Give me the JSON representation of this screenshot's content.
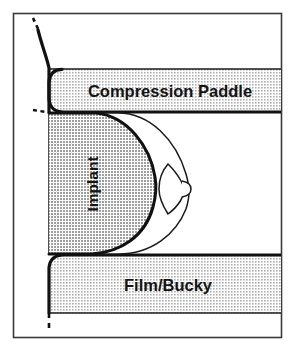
{
  "figure": {
    "type": "medical-line-diagram",
    "frame": {
      "border_color": "#3a3a3a",
      "background_color": "#ffffff",
      "x": 13,
      "y": 13,
      "width": 269,
      "height": 325
    }
  },
  "colors": {
    "outline": "#111111",
    "thin_outline": "#1a1a1a",
    "implant_fill": "#b8b8b8",
    "device_fill": "#d9d9d9",
    "breast_fill": "#ffffff",
    "frame_border": "#3a3a3a",
    "text": "#151515",
    "dash_line": "#111111"
  },
  "labels": {
    "compression_paddle": "Compression Paddle",
    "film_bucky": "Film/Bucky",
    "implant": "Implant"
  },
  "parts": [
    {
      "name": "compression-paddle",
      "label": "Compression Paddle",
      "role": "imaging-device",
      "position": "top",
      "fill": "#d9d9d9",
      "label_rotation_deg": 0,
      "bounds": {
        "x": 48,
        "y": 69,
        "width": 229,
        "height": 43
      }
    },
    {
      "name": "film-bucky",
      "label": "Film/Bucky",
      "role": "imaging-device",
      "position": "bottom",
      "fill": "#d9d9d9",
      "label_rotation_deg": 0,
      "bounds": {
        "x": 48,
        "y": 255,
        "width": 229,
        "height": 58
      }
    },
    {
      "name": "implant",
      "label": "Implant",
      "role": "prosthesis",
      "position": "center-left",
      "fill": "#b8b8b8",
      "label_rotation_deg": -90,
      "bounds": {
        "x": 48,
        "y": 112,
        "width": 112,
        "height": 143
      }
    },
    {
      "name": "breast-tissue",
      "label": "",
      "role": "anatomy",
      "position": "center-right",
      "fill": "#ffffff",
      "label_rotation_deg": 0,
      "bounds": {
        "x": 48,
        "y": 112,
        "width": 140,
        "height": 143
      }
    },
    {
      "name": "nipple",
      "label": "",
      "role": "anatomy-detail",
      "position": "right",
      "fill": "#ffffff",
      "label_rotation_deg": 0,
      "bounds": {
        "x": 158,
        "y": 163,
        "width": 32,
        "height": 50
      }
    },
    {
      "name": "chest-wall",
      "label": "",
      "role": "anatomy-reference-line",
      "position": "left",
      "fill": "none",
      "label_rotation_deg": 0,
      "bounds": {
        "x": 33,
        "y": 18,
        "width": 20,
        "height": 310
      }
    }
  ],
  "annotations": {
    "chest_wall_dash_top": "dashed reference segment at superior chest wall",
    "chest_wall_dash_bottom": "dashed reference segment at inferior chest wall",
    "implant_margin_ticks": "dashed tick marks at posterior implant margin"
  }
}
